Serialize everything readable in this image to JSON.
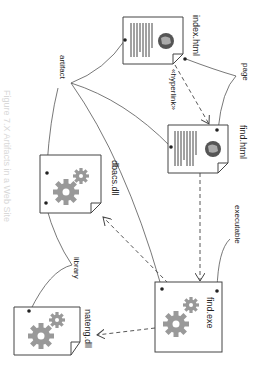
{
  "diagram": {
    "caption": "Figure 7.X  Artifacts in a Web Site",
    "orientation": "rotated 90deg clockwise",
    "colors": {
      "line": "#444444",
      "gear": "#999999",
      "text": "#222222",
      "doc_border": "#444444",
      "globe": "#555555"
    },
    "stereotypes": {
      "artifact": "artifact",
      "page": "page",
      "executable": "executable",
      "library": "library"
    },
    "artifacts": [
      {
        "id": "index",
        "name": "index.html",
        "kind": "page"
      },
      {
        "id": "find_html",
        "name": "find.html",
        "kind": "page"
      },
      {
        "id": "find_exe",
        "name": "find.exe",
        "kind": "executable"
      },
      {
        "id": "dbacs",
        "name": "dbacs.dll",
        "kind": "library"
      },
      {
        "id": "nateng",
        "name": "nateng.dll",
        "kind": "library"
      }
    ],
    "dependencies": [
      {
        "from": "index.html",
        "to": "find.html",
        "label": "«hyperlink»",
        "style": "dashed"
      },
      {
        "from": "find.html",
        "to": "find.exe",
        "label": "",
        "style": "dashed"
      },
      {
        "from": "find.exe",
        "to": "dbacs.dll",
        "label": "",
        "style": "dashed"
      },
      {
        "from": "find.exe",
        "to": "nateng.dll",
        "label": "",
        "style": "dashed"
      }
    ],
    "hyperlink_label": "«hyperlink»"
  }
}
